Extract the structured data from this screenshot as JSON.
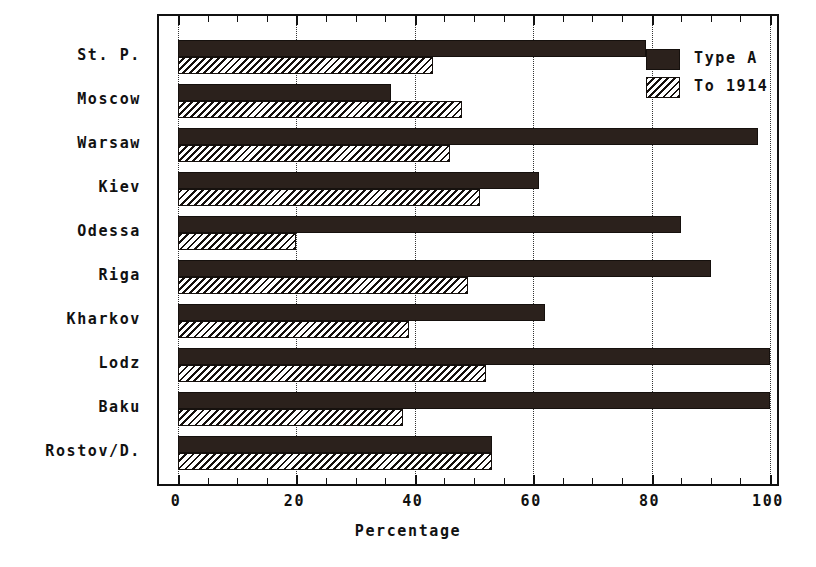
{
  "chart_data": {
    "type": "bar",
    "orientation": "horizontal",
    "title": "",
    "xlabel": "Percentage",
    "ylabel": "",
    "xlim": [
      0,
      100
    ],
    "xticks": [
      0,
      20,
      40,
      60,
      80,
      100
    ],
    "xticklabels": [
      "0",
      "20",
      "40",
      "60",
      "80",
      "100"
    ],
    "grid": "vertical-dotted",
    "legend_position": "top-right",
    "categories": [
      "St. P.",
      "Moscow",
      "Warsaw",
      "Kiev",
      "Odessa",
      "Riga",
      "Kharkov",
      "Lodz",
      "Baku",
      "Rostov/D."
    ],
    "series": [
      {
        "name": "Type A",
        "pattern": "solid",
        "color": "#2b211c",
        "values": [
          79,
          36,
          98,
          61,
          85,
          90,
          62,
          100,
          100,
          53
        ]
      },
      {
        "name": "To 1914",
        "pattern": "hatched",
        "color": "#15100d",
        "values": [
          43,
          48,
          46,
          51,
          20,
          49,
          39,
          52,
          38,
          53
        ]
      }
    ]
  },
  "legend": {
    "items": [
      {
        "label": "Type A",
        "swatch": "solid-swatch"
      },
      {
        "label": "To 1914",
        "swatch": "hatched-swatch"
      }
    ]
  },
  "axis": {
    "x_title": "Percentage"
  }
}
